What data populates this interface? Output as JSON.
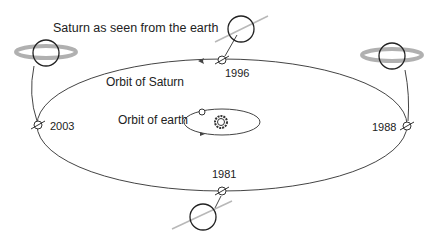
{
  "diagram": {
    "title": "Saturn as seen from the earth",
    "orbit_saturn_label": "Orbit of Saturn",
    "orbit_earth_label": "Orbit of earth",
    "positions": [
      {
        "year": "1996",
        "view": "edge-on"
      },
      {
        "year": "1988",
        "view": "rings wide open"
      },
      {
        "year": "1981",
        "view": "edge-on"
      },
      {
        "year": "2003",
        "view": "rings wide open"
      }
    ],
    "colors": {
      "line": "#333333",
      "ring": "#b0b0b0",
      "text": "#222222"
    }
  }
}
